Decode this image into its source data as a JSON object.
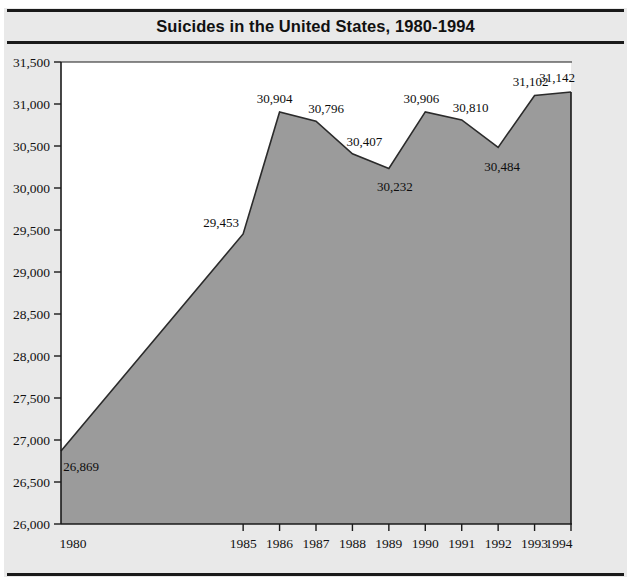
{
  "figure": {
    "title": "Suicides in the United States, 1980-1994",
    "background_color": "#e9e9e9",
    "plot_background_color": "#ffffff",
    "frame_color": "#1a1a1a"
  },
  "chart_data": {
    "type": "area",
    "title": "Suicides in the United States, 1980-1994",
    "xlabel": "",
    "ylabel": "",
    "categories": [
      "1980",
      "1985",
      "1986",
      "1987",
      "1988",
      "1989",
      "1990",
      "1991",
      "1992",
      "1993",
      "1994"
    ],
    "x": [
      1980,
      1985,
      1986,
      1987,
      1988,
      1989,
      1990,
      1991,
      1992,
      1993,
      1994
    ],
    "values": [
      26869,
      29453,
      30904,
      30796,
      30407,
      30232,
      30906,
      30810,
      30484,
      31102,
      31142
    ],
    "point_labels": [
      "26,869",
      "29,453",
      "30,904",
      "30,796",
      "30,407",
      "30,232",
      "30,906",
      "30,810",
      "30,484",
      "31,102",
      "31,142"
    ],
    "xlim": [
      1980,
      1994
    ],
    "ylim": [
      26000,
      31500
    ],
    "ytick_values": [
      26000,
      26500,
      27000,
      27500,
      28000,
      28500,
      29000,
      29500,
      30000,
      30500,
      31000,
      31500
    ],
    "ytick_labels": [
      "26,000",
      "26,500",
      "27,000",
      "27,500",
      "28,000",
      "28,500",
      "29,000",
      "29,500",
      "30,000",
      "30,500",
      "31,000",
      "31,500"
    ],
    "xtick_values": [
      1980,
      1985,
      1986,
      1987,
      1988,
      1989,
      1990,
      1991,
      1992,
      1993,
      1994
    ],
    "xtick_labels": [
      "1980",
      "1985",
      "1986",
      "1987",
      "1988",
      "1989",
      "1990",
      "1991",
      "1992",
      "1993",
      "1994"
    ],
    "grid": false,
    "legend": null,
    "area_fill_color": "#9b9b9b",
    "line_color": "#2b2b2b",
    "series_name": "Suicides"
  }
}
